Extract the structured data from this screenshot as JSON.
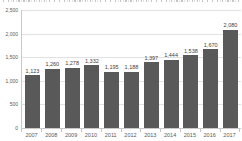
{
  "page": {
    "background_color": "#ffffff"
  },
  "chart_data": {
    "type": "bar",
    "title": "",
    "xlabel": "",
    "ylabel": "",
    "categories": [
      "2007",
      "2008",
      "2009",
      "2010",
      "2011",
      "2012",
      "2013",
      "2014",
      "2015",
      "2016",
      "2017"
    ],
    "values": [
      1123,
      1260,
      1278,
      1332,
      1195,
      1188,
      1397,
      1444,
      1538,
      1670,
      2080
    ],
    "value_labels": [
      "1,123",
      "1,260",
      "1,278",
      "1,332",
      "1,195",
      "1,188",
      "1,397",
      "1,444",
      "1,538",
      "1,670",
      "2,080"
    ],
    "ylim": [
      0,
      2500
    ],
    "y_ticks": [
      {
        "value": 0,
        "label": "0"
      },
      {
        "value": 500,
        "label": "500"
      },
      {
        "value": 1000,
        "label": "1,000"
      },
      {
        "value": 1500,
        "label": "1,500"
      },
      {
        "value": 2000,
        "label": "2,000"
      },
      {
        "value": 2500,
        "label": "2,500"
      }
    ],
    "grid": "horizontal",
    "legend": "none",
    "bar_color": "#595959",
    "value_label_color": "#404040",
    "axis_text_color": "#595959",
    "gridline_color": "#e2e2e2",
    "axis_line_color": "#c9c9c9"
  }
}
